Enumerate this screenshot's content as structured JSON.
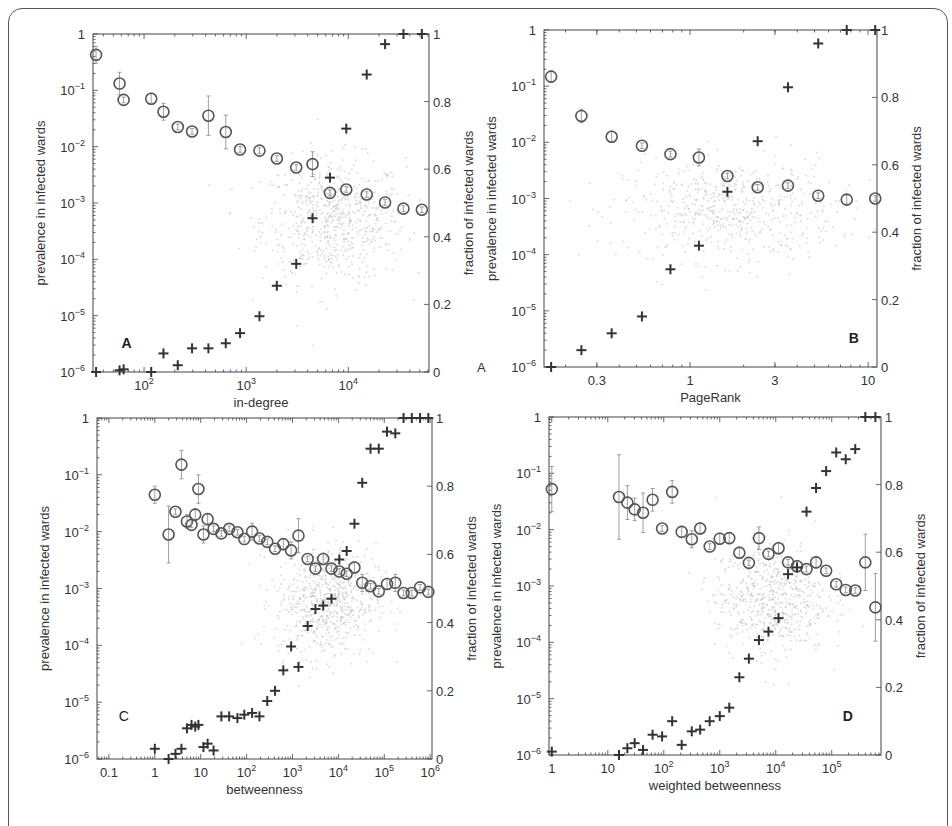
{
  "figure": {
    "left_axis_label": "prevalence in infected wards",
    "right_axis_label": "fraction of infected wards",
    "stray_label": "A"
  },
  "colors": {
    "circle": "#555555",
    "plus": "#333333",
    "cloud": "#bbbbbb",
    "axis": "#444444"
  },
  "chart_data": [
    {
      "type": "scatter",
      "panel": "A",
      "title": "",
      "xlabel": "in-degree",
      "ylabel": "prevalence in infected wards",
      "ylabel_right": "fraction of infected wards",
      "xscale": "log",
      "yscale": "log",
      "xlim_log10": [
        1.5,
        4.79
      ],
      "ylim": [
        1e-06,
        1
      ],
      "ylim_right": [
        0,
        1
      ],
      "x_ticks": [
        {
          "v": 2,
          "label": "10^2"
        },
        {
          "v": 3,
          "label": "10^3"
        },
        {
          "v": 4,
          "label": "10^4"
        }
      ],
      "box": {
        "x0": 93,
        "y0": 34,
        "x1": 429,
        "y1": 372
      },
      "letter_pos": [
        0.1,
        0.93
      ],
      "series": [
        {
          "name": "mean prevalence (circles, left axis)",
          "marker": "circle",
          "log10_x": [
            1.53,
            1.76,
            1.8,
            2.07,
            2.19,
            2.33,
            2.47,
            2.63,
            2.8,
            2.94,
            3.13,
            3.3,
            3.49,
            3.65,
            3.82,
            3.98,
            4.18,
            4.36,
            4.54,
            4.72
          ],
          "log10_y": [
            -0.37,
            -0.88,
            -1.17,
            -1.15,
            -1.38,
            -1.65,
            -1.73,
            -1.45,
            -1.74,
            -2.05,
            -2.07,
            -2.21,
            -2.37,
            -2.31,
            -2.82,
            -2.76,
            -2.85,
            -2.99,
            -3.1,
            -3.12
          ],
          "err_log10": [
            0.15,
            0.2,
            0.05,
            0.1,
            0.15,
            0.05,
            0.05,
            0.35,
            0.3,
            0.05,
            0.05,
            0.05,
            0.05,
            0.22,
            0.05,
            0.05,
            0.05,
            0.05,
            0.05,
            0.05
          ]
        },
        {
          "name": "fraction of infected wards (plus, right axis)",
          "marker": "plus",
          "log10_x": [
            1.53,
            1.76,
            1.8,
            2.07,
            2.19,
            2.33,
            2.47,
            2.63,
            2.8,
            2.94,
            3.13,
            3.3,
            3.49,
            3.65,
            3.82,
            3.98,
            4.18,
            4.36,
            4.54,
            4.72
          ],
          "values": [
            0.0,
            0.005,
            0.008,
            0.0,
            0.055,
            0.02,
            0.07,
            0.07,
            0.085,
            0.115,
            0.165,
            0.255,
            0.32,
            0.455,
            0.575,
            0.72,
            0.88,
            0.97,
            1.0,
            1.0
          ]
        }
      ],
      "cloud": {
        "cx_log10": 3.85,
        "cy_log10": -3.3,
        "sx": 0.35,
        "sy": 0.55,
        "n": 700
      }
    },
    {
      "type": "scatter",
      "panel": "B",
      "title": "",
      "xlabel": "PageRank",
      "ylabel": "prevalence in infected wards",
      "ylabel_right": "fraction of infected wards",
      "xscale": "log",
      "yscale": "log",
      "xlim_log10": [
        -0.82,
        1.05
      ],
      "ylim": [
        1e-06,
        1
      ],
      "ylim_right": [
        0,
        1
      ],
      "x_ticks": [
        {
          "v": -0.523,
          "label": "0.3"
        },
        {
          "v": 0,
          "label": "1"
        },
        {
          "v": 0.477,
          "label": "3"
        },
        {
          "v": 1,
          "label": "10"
        }
      ],
      "box": {
        "x0": 544,
        "y0": 30,
        "x1": 877,
        "y1": 367
      },
      "letter_pos": [
        0.93,
        0.93
      ],
      "series": [
        {
          "name": "mean prevalence (circles, left axis)",
          "marker": "circle",
          "log10_x": [
            -0.78,
            -0.61,
            -0.44,
            -0.27,
            -0.11,
            0.05,
            0.21,
            0.38,
            0.55,
            0.72,
            0.88,
            1.04
          ],
          "log10_y": [
            -0.83,
            -1.53,
            -1.9,
            -2.06,
            -2.21,
            -2.27,
            -2.6,
            -2.8,
            -2.77,
            -2.95,
            -3.02,
            -3.0
          ],
          "err_log10": [
            0.1,
            0.12,
            0.1,
            0.05,
            0.05,
            0.15,
            0.05,
            0.05,
            0.05,
            0.05,
            0.08,
            0.05
          ]
        },
        {
          "name": "fraction of infected wards (plus, right axis)",
          "marker": "plus",
          "log10_x": [
            -0.78,
            -0.61,
            -0.44,
            -0.27,
            -0.11,
            0.05,
            0.21,
            0.38,
            0.55,
            0.72,
            0.88,
            1.04
          ],
          "values": [
            0.0,
            0.05,
            0.1,
            0.15,
            0.29,
            0.36,
            0.52,
            0.67,
            0.83,
            0.96,
            1.0,
            1.0
          ]
        }
      ],
      "cloud": {
        "cx_log10": 0.22,
        "cy_log10": -3.2,
        "sx": 0.3,
        "sy": 0.45,
        "n": 600
      }
    },
    {
      "type": "scatter",
      "panel": "C",
      "title": "",
      "xlabel": "betweenness",
      "ylabel": "prevalence in infected wards",
      "ylabel_right": "fraction of infected wards",
      "xscale": "log",
      "yscale": "log",
      "xlim_log10": [
        -1.26,
        6.04
      ],
      "ylim": [
        1e-06,
        1
      ],
      "ylim_right": [
        0,
        1
      ],
      "x_ticks": [
        {
          "v": -1,
          "label": "0.1"
        },
        {
          "v": 0,
          "label": "1"
        },
        {
          "v": 1,
          "label": "10"
        },
        {
          "v": 2,
          "label": "10^2"
        },
        {
          "v": 3,
          "label": "10^3"
        },
        {
          "v": 4,
          "label": "10^4"
        },
        {
          "v": 5,
          "label": "10^5"
        },
        {
          "v": 6,
          "label": "10^6"
        }
      ],
      "box": {
        "x0": 97,
        "y0": 418,
        "x1": 432,
        "y1": 759
      },
      "letter_pos": [
        0.08,
        0.89
      ],
      "series": [
        {
          "name": "mean prevalence (circles, left axis)",
          "marker": "circle",
          "log10_x": [
            0.0,
            0.3,
            0.45,
            0.58,
            0.7,
            0.8,
            0.88,
            0.95,
            1.06,
            1.15,
            1.28,
            1.45,
            1.62,
            1.8,
            1.95,
            2.12,
            2.28,
            2.45,
            2.62,
            2.8,
            2.97,
            3.13,
            3.33,
            3.5,
            3.67,
            3.85,
            4.02,
            4.18,
            4.35,
            4.52,
            4.7,
            4.88,
            5.06,
            5.24,
            5.42,
            5.6,
            5.78,
            5.96
          ],
          "log10_y": [
            -1.35,
            -2.05,
            -1.65,
            -0.82,
            -1.82,
            -1.88,
            -1.7,
            -1.25,
            -2.05,
            -1.78,
            -1.95,
            -2.03,
            -1.95,
            -2.01,
            -2.13,
            -2.0,
            -2.12,
            -2.18,
            -2.3,
            -2.22,
            -2.33,
            -2.07,
            -2.48,
            -2.65,
            -2.48,
            -2.65,
            -2.7,
            -2.74,
            -2.63,
            -2.9,
            -2.96,
            -3.05,
            -2.92,
            -2.9,
            -3.08,
            -3.08,
            -2.98,
            -3.06
          ],
          "err_log10": [
            0.15,
            0.5,
            0.05,
            0.25,
            0.12,
            0.05,
            0.1,
            0.25,
            0.15,
            0.1,
            0.05,
            0.05,
            0.05,
            0.05,
            0.05,
            0.15,
            0.05,
            0.05,
            0.05,
            0.1,
            0.15,
            0.3,
            0.05,
            0.05,
            0.1,
            0.05,
            0.05,
            0.05,
            0.1,
            0.15,
            0.05,
            0.05,
            0.1,
            0.15,
            0.05,
            0.05,
            0.05,
            0.05
          ]
        },
        {
          "name": "fraction of infected wards (plus, right axis)",
          "marker": "plus",
          "log10_x": [
            0.0,
            0.3,
            0.45,
            0.58,
            0.7,
            0.8,
            0.88,
            0.95,
            1.06,
            1.15,
            1.28,
            1.45,
            1.62,
            1.8,
            1.95,
            2.12,
            2.28,
            2.45,
            2.62,
            2.8,
            2.97,
            3.13,
            3.33,
            3.5,
            3.67,
            3.85,
            4.02,
            4.18,
            4.35,
            4.52,
            4.7,
            4.88,
            5.06,
            5.24,
            5.42,
            5.6,
            5.78,
            5.96
          ],
          "values": [
            0.03,
            0.0,
            0.015,
            0.03,
            0.09,
            0.1,
            0.095,
            0.1,
            0.035,
            0.045,
            0.025,
            0.125,
            0.125,
            0.12,
            0.13,
            0.135,
            0.125,
            0.17,
            0.2,
            0.26,
            0.33,
            0.27,
            0.39,
            0.44,
            0.45,
            0.47,
            0.585,
            0.61,
            0.69,
            0.81,
            0.91,
            0.91,
            0.96,
            0.955,
            1.0,
            1.0,
            1.0,
            1.0
          ]
        }
      ],
      "cloud": {
        "cx_log10": 3.7,
        "cy_log10": -3.2,
        "sx": 0.55,
        "sy": 0.5,
        "n": 700
      }
    },
    {
      "type": "scatter",
      "panel": "D",
      "title": "",
      "xlabel": "weighted betweenness",
      "ylabel": "prevalence in infected wards",
      "ylabel_right": "fraction of infected wards",
      "xscale": "log",
      "yscale": "log",
      "xlim_log10": [
        -0.05,
        5.88
      ],
      "ylim": [
        1e-06,
        1
      ],
      "ylim_right": [
        0,
        1
      ],
      "x_ticks": [
        {
          "v": 0,
          "label": "1"
        },
        {
          "v": 1,
          "label": "10"
        },
        {
          "v": 2,
          "label": "10^2"
        },
        {
          "v": 3,
          "label": "10^3"
        },
        {
          "v": 4,
          "label": "10^4"
        },
        {
          "v": 5,
          "label": "10^5"
        }
      ],
      "box": {
        "x0": 549,
        "y0": 417,
        "x1": 881,
        "y1": 755
      },
      "letter_pos": [
        0.9,
        0.9
      ],
      "series": [
        {
          "name": "mean prevalence (circles, left axis)",
          "marker": "circle",
          "log10_x": [
            0.0,
            1.2,
            1.35,
            1.48,
            1.63,
            1.8,
            1.97,
            2.15,
            2.32,
            2.5,
            2.65,
            2.82,
            3.0,
            3.17,
            3.35,
            3.52,
            3.7,
            3.87,
            4.05,
            4.22,
            4.38,
            4.55,
            4.72,
            4.9,
            5.08,
            5.25,
            5.42,
            5.6,
            5.78
          ],
          "log10_y": [
            -1.28,
            -1.42,
            -1.52,
            -1.64,
            -1.7,
            -1.47,
            -1.98,
            -1.33,
            -2.04,
            -2.17,
            -1.98,
            -2.3,
            -2.16,
            -2.15,
            -2.41,
            -2.59,
            -2.15,
            -2.43,
            -2.33,
            -2.58,
            -2.65,
            -2.7,
            -2.58,
            -2.73,
            -2.97,
            -3.07,
            -3.08,
            -2.58,
            -3.38
          ],
          "err_log10": [
            0.4,
            0.75,
            0.3,
            0.2,
            0.35,
            0.2,
            0.05,
            0.2,
            0.1,
            0.15,
            0.1,
            0.05,
            0.1,
            0.1,
            0.1,
            0.05,
            0.2,
            0.05,
            0.1,
            0.05,
            0.1,
            0.05,
            0.1,
            0.05,
            0.05,
            0.05,
            0.05,
            0.5,
            0.6
          ]
        },
        {
          "name": "fraction of infected wards (plus, right axis)",
          "marker": "plus",
          "log10_x": [
            0.0,
            1.2,
            1.35,
            1.48,
            1.63,
            1.8,
            1.97,
            2.15,
            2.32,
            2.5,
            2.65,
            2.82,
            3.0,
            3.17,
            3.35,
            3.52,
            3.7,
            3.87,
            4.05,
            4.22,
            4.38,
            4.55,
            4.72,
            4.9,
            5.08,
            5.25,
            5.42,
            5.6,
            5.78
          ],
          "values": [
            0.01,
            0.0,
            0.02,
            0.035,
            0.015,
            0.06,
            0.055,
            0.1,
            0.03,
            0.07,
            0.075,
            0.1,
            0.115,
            0.14,
            0.23,
            0.285,
            0.34,
            0.365,
            0.405,
            0.535,
            0.555,
            0.72,
            0.79,
            0.84,
            0.895,
            0.875,
            0.905,
            1.0,
            1.0
          ]
        }
      ],
      "cloud": {
        "cx_log10": 3.9,
        "cy_log10": -3.2,
        "sx": 0.5,
        "sy": 0.5,
        "n": 650
      }
    }
  ]
}
